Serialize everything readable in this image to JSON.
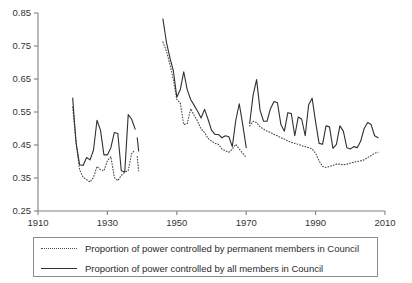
{
  "chart_data": {
    "type": "line",
    "title": "",
    "xlabel": "",
    "ylabel": "",
    "xlim": [
      1910,
      2010
    ],
    "ylim": [
      0.25,
      0.85
    ],
    "grid": false,
    "legend_position": "bottom",
    "xticks": [
      "1910",
      "1930",
      "1950",
      "1970",
      "1990",
      "2010"
    ],
    "yticks": [
      "0.25",
      "0.35",
      "0.45",
      "0.55",
      "0.65",
      "0.75",
      "0.85"
    ],
    "series": [
      {
        "name": "Proportion of power controlled by permanent members in Council",
        "style": "dotted",
        "segments": [
          {
            "x": [
              1920,
              1921,
              1922,
              1923,
              1924,
              1925,
              1926,
              1927,
              1928,
              1929,
              1930,
              1931,
              1932,
              1933,
              1934,
              1935,
              1936,
              1937,
              1938
            ],
            "values": [
              0.565,
              0.455,
              0.375,
              0.352,
              0.345,
              0.338,
              0.352,
              0.385,
              0.375,
              0.372,
              0.402,
              0.415,
              0.352,
              0.342,
              0.358,
              0.368,
              0.372,
              0.425,
              0.435
            ]
          },
          {
            "x": [
              1938.6,
              1939
            ],
            "values": [
              0.415,
              0.372
            ]
          },
          {
            "x": [
              1946,
              1947,
              1948,
              1949,
              1950,
              1951,
              1952,
              1953,
              1954,
              1955,
              1956,
              1957,
              1958,
              1959,
              1960,
              1961,
              1962,
              1963,
              1964,
              1965,
              1966,
              1967,
              1968,
              1969,
              1970
            ],
            "values": [
              0.762,
              0.735,
              0.695,
              0.648,
              0.588,
              0.578,
              0.512,
              0.515,
              0.56,
              0.54,
              0.522,
              0.498,
              0.488,
              0.47,
              0.462,
              0.455,
              0.452,
              0.438,
              0.432,
              0.428,
              0.438,
              0.452,
              0.438,
              0.425,
              0.412
            ]
          },
          {
            "x": [
              1971,
              1972,
              1973,
              1974,
              1975,
              1976,
              1977,
              1978,
              1979,
              1980,
              1981,
              1982,
              1983,
              1984,
              1985,
              1986,
              1987,
              1988,
              1989,
              1990,
              1991,
              1992,
              1993,
              1994,
              1995,
              1996,
              1997,
              1998,
              1999,
              2000,
              2001,
              2002,
              2003,
              2004,
              2005,
              2006,
              2007,
              2008
            ],
            "values": [
              0.508,
              0.522,
              0.518,
              0.505,
              0.498,
              0.492,
              0.488,
              0.482,
              0.478,
              0.472,
              0.468,
              0.462,
              0.458,
              0.455,
              0.452,
              0.448,
              0.445,
              0.442,
              0.438,
              0.425,
              0.402,
              0.385,
              0.382,
              0.385,
              0.388,
              0.392,
              0.392,
              0.39,
              0.392,
              0.395,
              0.398,
              0.4,
              0.402,
              0.405,
              0.412,
              0.418,
              0.425,
              0.428
            ]
          }
        ]
      },
      {
        "name": "Proportion of power controlled by all members in Council",
        "style": "solid",
        "segments": [
          {
            "x": [
              1920,
              1920.5,
              1921,
              1922,
              1923,
              1924,
              1925,
              1926,
              1927,
              1928,
              1929,
              1930,
              1931,
              1932,
              1933,
              1934,
              1935,
              1936,
              1937,
              1938
            ],
            "values": [
              0.592,
              0.52,
              0.455,
              0.39,
              0.388,
              0.412,
              0.405,
              0.435,
              0.525,
              0.495,
              0.42,
              0.42,
              0.442,
              0.488,
              0.485,
              0.372,
              0.368,
              0.542,
              0.528,
              0.498
            ]
          },
          {
            "x": [
              1938.6,
              1939
            ],
            "values": [
              0.472,
              0.432
            ]
          },
          {
            "x": [
              1946,
              1947,
              1948,
              1949,
              1950,
              1951,
              1952,
              1953,
              1954,
              1955,
              1956,
              1957,
              1958,
              1959,
              1960,
              1961,
              1962,
              1963,
              1964,
              1965,
              1966,
              1967,
              1968,
              1969,
              1970
            ],
            "values": [
              0.832,
              0.762,
              0.715,
              0.675,
              0.595,
              0.618,
              0.672,
              0.618,
              0.588,
              0.57,
              0.552,
              0.532,
              0.558,
              0.528,
              0.495,
              0.482,
              0.482,
              0.472,
              0.478,
              0.475,
              0.445,
              0.525,
              0.575,
              0.512,
              0.442
            ]
          },
          {
            "x": [
              1971,
              1972,
              1973,
              1974,
              1975,
              1976,
              1977,
              1978,
              1979,
              1980,
              1981,
              1982,
              1983,
              1984,
              1985,
              1986,
              1987,
              1988,
              1989,
              1990,
              1991,
              1992,
              1993,
              1994,
              1995,
              1996,
              1997,
              1998,
              1999,
              2000,
              2001,
              2002,
              2003,
              2004,
              2005,
              2006,
              2007,
              2008
            ],
            "values": [
              0.515,
              0.602,
              0.648,
              0.555,
              0.522,
              0.522,
              0.56,
              0.582,
              0.578,
              0.512,
              0.492,
              0.548,
              0.545,
              0.478,
              0.535,
              0.528,
              0.478,
              0.572,
              0.592,
              0.52,
              0.455,
              0.452,
              0.508,
              0.505,
              0.44,
              0.452,
              0.508,
              0.492,
              0.442,
              0.438,
              0.445,
              0.442,
              0.462,
              0.5,
              0.518,
              0.512,
              0.478,
              0.472
            ]
          }
        ]
      }
    ]
  },
  "legend": {
    "items": [
      {
        "label": "Proportion of power controlled by permanent members in Council",
        "style": "dotted"
      },
      {
        "label": "Proportion of power controlled by all members in Council",
        "style": "solid"
      }
    ]
  }
}
